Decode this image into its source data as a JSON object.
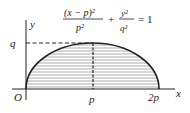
{
  "diagram": {
    "equation": {
      "num1": "(x − p)²",
      "den1": "p²",
      "plus": "+",
      "num2": "y²",
      "den2": "q²",
      "equals": "= 1"
    },
    "labels": {
      "y_axis": "y",
      "x_axis": "x",
      "origin": "O",
      "q": "q",
      "p": "p",
      "two_p": "2p"
    },
    "colors": {
      "ink": "#222222",
      "hatch": "#555555",
      "background": "#ffffff"
    }
  }
}
